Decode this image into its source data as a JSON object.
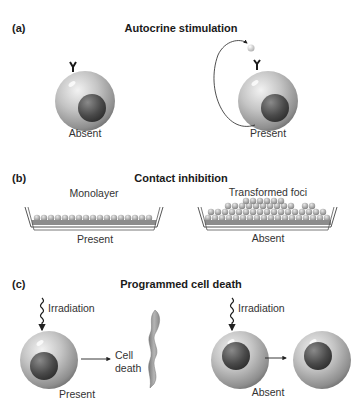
{
  "panels": {
    "a": {
      "letter": "(a)",
      "title": "Autocrine stimulation",
      "left_label": "Absent",
      "right_label": "Present"
    },
    "b": {
      "letter": "(b)",
      "title": "Contact inhibition",
      "left_caption": "Monolayer",
      "left_label": "Present",
      "right_caption": "Transformed foci",
      "right_label": "Absent"
    },
    "c": {
      "letter": "(c)",
      "title": "Programmed cell death",
      "left_irradiation": "Irradiation",
      "cell_death_line1": "Cell",
      "cell_death_line2": "death",
      "left_label": "Present",
      "right_irradiation": "Irradiation",
      "right_label": "Absent"
    }
  },
  "colors": {
    "cell_outer": "#b8b8b8",
    "cell_nucleus": "#555555",
    "dish_line": "#555555",
    "text": "#1a1a1a"
  }
}
